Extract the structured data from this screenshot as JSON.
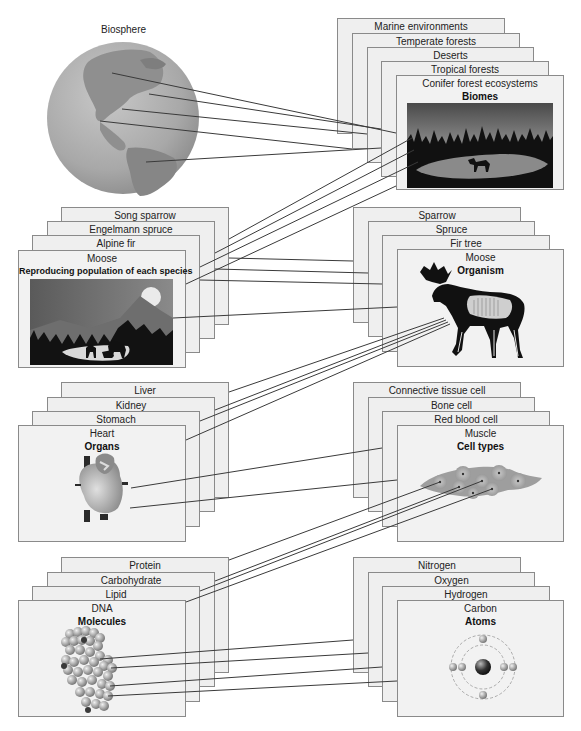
{
  "biosphere": {
    "label": "Biosphere"
  },
  "levels": {
    "biomes": {
      "title": "Biomes",
      "cards": [
        "Marine environments",
        "Temperate forests",
        "Deserts",
        "Tropical forests",
        "Conifer forest ecosystems"
      ]
    },
    "population": {
      "title": "Reproducing population of each species",
      "cards": [
        "Song sparrow",
        "Engelmann spruce",
        "Alpine fir",
        "Moose"
      ]
    },
    "organism": {
      "title": "Organism",
      "cards": [
        "Sparrow",
        "Spruce",
        "Fir tree",
        "Moose"
      ]
    },
    "organs": {
      "title": "Organs",
      "cards": [
        "Liver",
        "Kidney",
        "Stomach",
        "Heart"
      ]
    },
    "cells": {
      "title": "Cell types",
      "cards": [
        "Connective tissue cell",
        "Bone cell",
        "Red blood cell",
        "Muscle"
      ]
    },
    "molecules": {
      "title": "Molecules",
      "cards": [
        "Protein",
        "Carbohydrate",
        "Lipid",
        "DNA"
      ]
    },
    "atoms": {
      "title": "Atoms",
      "cards": [
        "Nitrogen",
        "Oxygen",
        "Hydrogen",
        "Carbon"
      ]
    }
  },
  "colors": {
    "card_fill": "#efefef",
    "card_border": "#8a8a8a",
    "line": "#3a3a3a",
    "globe": "#a9a9a9"
  }
}
